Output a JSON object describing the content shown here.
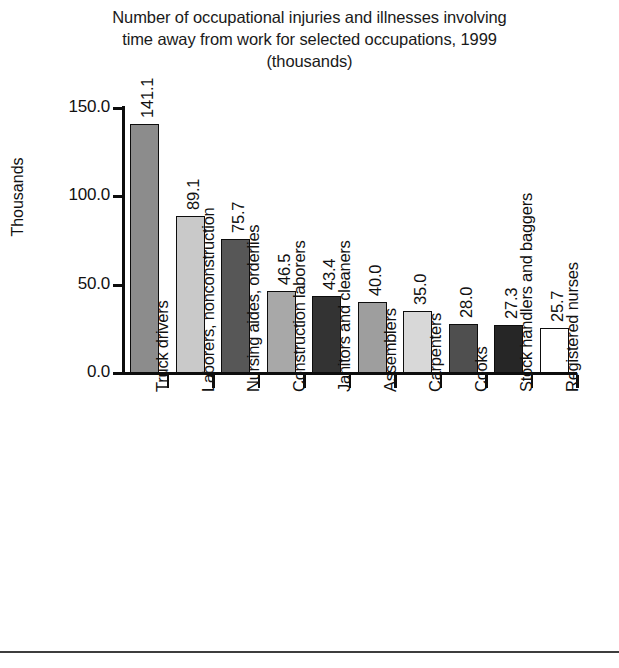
{
  "chart_data": {
    "type": "bar",
    "title": "Number of occupational injuries and illnesses involving time away from work for selected occupations, 1999 (thousands)",
    "title_lines": [
      "Number of occupational injuries and illnesses involving",
      "time away from work for selected occupations, 1999",
      "(thousands)"
    ],
    "xlabel": "",
    "ylabel": "Thousands",
    "ylim": [
      0.0,
      150.0
    ],
    "yticks": [
      "0.0",
      "50.0",
      "100.0",
      "150.0"
    ],
    "ytick_values": [
      0.0,
      50.0,
      100.0,
      150.0
    ],
    "grid": false,
    "legend": false,
    "categories": [
      "Truck drivers",
      "Laborers, nonconstruction",
      "Nursing aides, orderlies",
      "Construction laborers",
      "Janitors and cleaners",
      "Assemblers",
      "Carpenters",
      "Cooks",
      "Stock handlers and baggers",
      "Registered nurses"
    ],
    "values": [
      141.1,
      89.1,
      75.7,
      46.5,
      43.4,
      40.0,
      35.0,
      28.0,
      27.3,
      25.7
    ],
    "value_labels": [
      "141.1",
      "89.1",
      "75.7",
      "46.5",
      "43.4",
      "40.0",
      "35.0",
      "28.0",
      "27.3",
      "25.7"
    ],
    "bar_colors": [
      "#8c8c8c",
      "#c9c9c9",
      "#575757",
      "#a8a8a8",
      "#333333",
      "#9e9e9e",
      "#d8d8d8",
      "#4f4f4f",
      "#262626",
      "#ffffff"
    ],
    "bar_outline_color": "#0d0d0d",
    "axis_color": "#0d0d0d",
    "text_color": "#111111",
    "background_color": "#ffffff"
  }
}
